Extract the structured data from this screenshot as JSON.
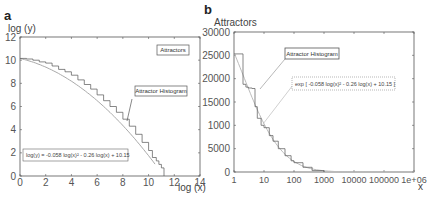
{
  "chart_data": [
    {
      "panel": "a",
      "type": "line",
      "title": "",
      "xlabel": "log (x)",
      "ylabel": "log (y)",
      "xlim": [
        0,
        14
      ],
      "ylim": [
        0,
        12
      ],
      "xticks": [
        "0",
        "2",
        "4",
        "6",
        "8",
        "10",
        "12",
        "14"
      ],
      "yticks": [
        "0",
        "2",
        "4",
        "6",
        "8",
        "10",
        "12"
      ],
      "grid": false,
      "legend": {
        "label": "Attractors",
        "position": "top-right"
      },
      "annotations": [
        {
          "text": "Attractor Histogram",
          "points_to": [
            8.3,
            4.6
          ]
        },
        {
          "text": "log(y) = -0.058 log(x)² - 0.26 log(x) + 10.15",
          "position": "bottom-left"
        }
      ],
      "series": [
        {
          "name": "Attractor Histogram",
          "style": "step",
          "x": [
            0,
            0.5,
            1,
            1.5,
            2,
            2.5,
            3,
            3.5,
            4,
            4.5,
            5,
            5.5,
            6,
            6.5,
            7,
            7.5,
            8,
            8.5,
            9,
            9.5,
            10,
            10.3,
            10.6,
            10.8,
            11.0,
            11.2
          ],
          "y": [
            10.15,
            10.1,
            10.0,
            9.85,
            9.75,
            9.5,
            9.2,
            9.0,
            8.7,
            8.3,
            7.9,
            7.5,
            7.0,
            6.5,
            6.0,
            5.5,
            4.9,
            4.3,
            3.6,
            2.9,
            2.2,
            1.6,
            1.3,
            1.0,
            0.7,
            0.0
          ]
        },
        {
          "name": "Fit",
          "style": "line",
          "formula": "log(y) = -0.058 log(x)^2 - 0.26 log(x) + 10.15",
          "coefficients": {
            "a": -0.058,
            "b": -0.26,
            "c": 10.15
          },
          "x_range": [
            0,
            10.5
          ]
        }
      ]
    },
    {
      "panel": "b",
      "type": "line",
      "title": "",
      "xlabel": "x",
      "ylabel": "Attractors",
      "xscale": "log",
      "xlim": [
        1,
        1000000
      ],
      "ylim": [
        0,
        30000
      ],
      "xticks": [
        "1",
        "10",
        "100",
        "1000",
        "10000",
        "100000",
        "1e+06"
      ],
      "yticks": [
        "0",
        "5000",
        "1000",
        "15000",
        "20000",
        "25000",
        "30000"
      ],
      "grid": false,
      "annotations": [
        {
          "text": "Attractor Histogram",
          "points_to": [
            4.5,
            17900
          ]
        },
        {
          "text": "exp [ -0.058 log(x)² - 0.26 log(x) + 10.15 ]",
          "points_to": [
            6,
            10500
          ]
        }
      ],
      "series": [
        {
          "name": "Attractor Histogram",
          "style": "step",
          "x": [
            1,
            2,
            2.5,
            3,
            4,
            5,
            6,
            8,
            10,
            15,
            20,
            30,
            50,
            80,
            100,
            200,
            400,
            1000
          ],
          "y": [
            25300,
            18800,
            18200,
            18000,
            17900,
            14000,
            11500,
            10000,
            9500,
            7800,
            6600,
            5000,
            3500,
            2400,
            2000,
            1000,
            300,
            0
          ]
        },
        {
          "name": "Fit",
          "style": "line",
          "formula": "exp[ -0.058 log(x)^2 - 0.26 log(x) + 10.15 ]",
          "coefficients": {
            "a": -0.058,
            "b": -0.26,
            "c": 10.15
          },
          "x_range": [
            1,
            1000000
          ]
        }
      ]
    }
  ]
}
